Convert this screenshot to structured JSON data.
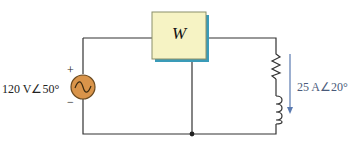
{
  "diagram": {
    "type": "circuit",
    "source": {
      "magnitude_label": "120 V∠50°",
      "plus": "+",
      "minus": "−",
      "icon": "ac-source-icon"
    },
    "wattmeter": {
      "label": "W"
    },
    "load": {
      "components": [
        "resistor",
        "inductor"
      ],
      "current_label": "25 A∠20°"
    },
    "colors": {
      "wire": "#333333",
      "meter_fill": "#f6f3c4",
      "meter_border": "#8a8f6a",
      "meter_shadow": "#3a9bb8",
      "source_fill": "#d9944a",
      "arrow": "#5a7ab0"
    }
  }
}
